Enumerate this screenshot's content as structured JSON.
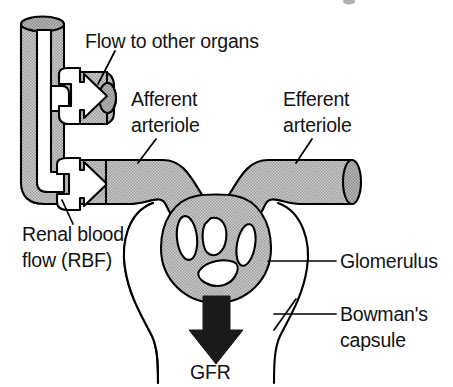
{
  "figure": {
    "type": "anatomical-diagram",
    "width": 453,
    "height": 387,
    "background_color": "#ffffff",
    "line_color": "#000000",
    "vessel_fill_color": "#b8b8b8",
    "capsule_fill_color": "#ffffff",
    "gfr_arrow_color": "#1a1a1a"
  },
  "labels": {
    "flow_to_other_organs": "Flow to other organs",
    "afferent_line1": "Afferent",
    "afferent_line2": "arteriole",
    "efferent_line1": "Efferent",
    "efferent_line2": "arteriole",
    "renal_blood_flow_line1": "Renal blood",
    "renal_blood_flow_line2": "flow (RBF)",
    "glomerulus": "Glomerulus",
    "bowmans_line1": "Bowman's",
    "bowmans_line2": "capsule",
    "gfr": "GFR"
  },
  "structures": [
    {
      "name": "renal-artery-trunk",
      "description": "Vertical stippled blood vessel at left with elliptical top cap"
    },
    {
      "name": "branch-vessel",
      "description": "Horizontal stippled branch to the right with elliptical cut end"
    },
    {
      "name": "afferent-arteriole",
      "description": "Stippled vessel entering glomerulus from the left"
    },
    {
      "name": "efferent-arteriole",
      "description": "Stippled vessel leaving glomerulus to the right, elliptical cut end"
    },
    {
      "name": "glomerulus",
      "description": "Stippled capillary tuft with white lumen gaps"
    },
    {
      "name": "bowmans-capsule",
      "description": "White cup-shaped capsule surrounding the glomerulus"
    },
    {
      "name": "flow-arrow-branch",
      "description": "White outlined arrow pointing right into branch vessel"
    },
    {
      "name": "flow-arrow-afferent",
      "description": "White outlined arrow pointing right into afferent arteriole"
    },
    {
      "name": "gfr-arrow",
      "description": "Solid dark arrow pointing down out of the glomerulus"
    }
  ]
}
